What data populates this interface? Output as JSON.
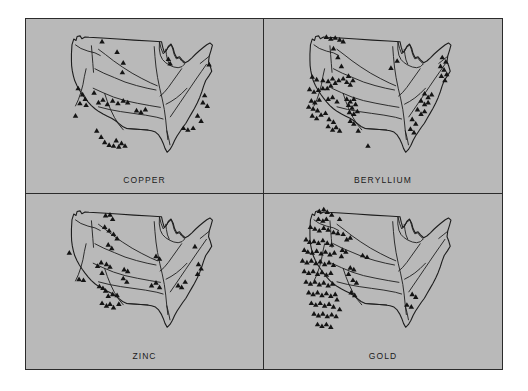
{
  "figure": {
    "background_color": "#b9b9b9",
    "page_background_color": "#ffffff",
    "border_color": "#2b2b2b",
    "marker_color": "#141414",
    "marker_shape": "filled-triangle",
    "outline_color": "#1d1d1d",
    "panel_count": 4,
    "map_subject": "United States"
  },
  "panels": [
    {
      "id": "copper",
      "label": "COPPER",
      "position": "top-left",
      "marker_count": 41
    },
    {
      "id": "beryllium",
      "label": "BERYLLIUM",
      "position": "top-right",
      "marker_count": 77
    },
    {
      "id": "zinc",
      "label": "ZINC",
      "position": "bottom-left",
      "marker_count": 43
    },
    {
      "id": "gold",
      "label": "GOLD",
      "position": "bottom-right",
      "marker_count": 95
    }
  ],
  "chart_data": {
    "type": "scatter",
    "title": "",
    "subtitle": "",
    "xlabel": "",
    "ylabel": "",
    "grid": false,
    "legend": "none",
    "panels": [
      {
        "name": "COPPER",
        "marker": "triangle",
        "count": 41,
        "points": [
          [
            26.0,
            11.5
          ],
          [
            34.5,
            17.5
          ],
          [
            38.0,
            23.5
          ],
          [
            37.5,
            29.0
          ],
          [
            12.5,
            38.0
          ],
          [
            15.0,
            41.5
          ],
          [
            16.5,
            44.0
          ],
          [
            13.5,
            46.5
          ],
          [
            17.0,
            47.5
          ],
          [
            21.5,
            40.5
          ],
          [
            24.0,
            46.0
          ],
          [
            26.5,
            44.5
          ],
          [
            29.0,
            47.0
          ],
          [
            32.0,
            45.0
          ],
          [
            35.0,
            46.5
          ],
          [
            38.0,
            45.0
          ],
          [
            40.5,
            46.0
          ],
          [
            11.0,
            53.5
          ],
          [
            23.0,
            62.0
          ],
          [
            25.5,
            65.5
          ],
          [
            27.5,
            68.5
          ],
          [
            30.0,
            70.0
          ],
          [
            32.5,
            70.5
          ],
          [
            34.0,
            67.5
          ],
          [
            35.5,
            71.0
          ],
          [
            37.0,
            69.0
          ],
          [
            39.0,
            70.5
          ],
          [
            45.5,
            50.5
          ],
          [
            48.0,
            51.5
          ],
          [
            50.5,
            50.0
          ],
          [
            63.5,
            21.5
          ],
          [
            64.5,
            24.0
          ],
          [
            86.5,
            24.5
          ],
          [
            84.0,
            42.0
          ],
          [
            83.0,
            46.0
          ],
          [
            85.5,
            48.0
          ],
          [
            80.0,
            53.5
          ],
          [
            82.0,
            56.5
          ],
          [
            77.5,
            60.5
          ],
          [
            74.5,
            61.5
          ],
          [
            72.0,
            60.5
          ]
        ]
      },
      {
        "name": "BERYLLIUM",
        "marker": "triangle",
        "count": 77,
        "points": [
          [
            18.0,
            9.0
          ],
          [
            20.5,
            10.0
          ],
          [
            23.0,
            9.5
          ],
          [
            25.5,
            10.5
          ],
          [
            27.5,
            11.5
          ],
          [
            22.0,
            15.5
          ],
          [
            24.5,
            20.5
          ],
          [
            26.5,
            25.5
          ],
          [
            10.0,
            31.5
          ],
          [
            12.5,
            33.0
          ],
          [
            16.0,
            33.5
          ],
          [
            19.0,
            34.0
          ],
          [
            21.5,
            32.5
          ],
          [
            8.5,
            38.5
          ],
          [
            11.0,
            40.0
          ],
          [
            13.5,
            39.0
          ],
          [
            16.0,
            38.0
          ],
          [
            18.5,
            38.0
          ],
          [
            20.5,
            36.5
          ],
          [
            23.0,
            35.0
          ],
          [
            25.0,
            33.5
          ],
          [
            27.5,
            32.5
          ],
          [
            29.5,
            34.5
          ],
          [
            9.5,
            45.0
          ],
          [
            11.5,
            46.0
          ],
          [
            14.0,
            44.5
          ],
          [
            8.0,
            48.5
          ],
          [
            10.5,
            49.5
          ],
          [
            13.0,
            50.5
          ],
          [
            10.0,
            53.5
          ],
          [
            12.5,
            55.0
          ],
          [
            15.0,
            53.0
          ],
          [
            19.0,
            44.0
          ],
          [
            21.5,
            43.0
          ],
          [
            24.0,
            45.5
          ],
          [
            17.5,
            52.0
          ],
          [
            19.5,
            55.5
          ],
          [
            22.0,
            57.0
          ],
          [
            19.0,
            59.5
          ],
          [
            21.5,
            61.5
          ],
          [
            23.5,
            60.0
          ],
          [
            25.5,
            62.0
          ],
          [
            30.5,
            31.0
          ],
          [
            33.0,
            33.5
          ],
          [
            31.5,
            36.0
          ],
          [
            29.5,
            44.0
          ],
          [
            31.5,
            45.5
          ],
          [
            33.5,
            44.0
          ],
          [
            30.5,
            47.5
          ],
          [
            32.5,
            49.0
          ],
          [
            34.5,
            47.0
          ],
          [
            31.0,
            51.5
          ],
          [
            33.5,
            52.5
          ],
          [
            35.5,
            51.0
          ],
          [
            31.5,
            56.5
          ],
          [
            33.5,
            58.0
          ],
          [
            36.0,
            62.0
          ],
          [
            41.5,
            70.5
          ],
          [
            58.0,
            22.5
          ],
          [
            54.5,
            26.5
          ],
          [
            83.5,
            20.5
          ],
          [
            85.5,
            23.0
          ],
          [
            82.5,
            25.5
          ],
          [
            84.5,
            27.5
          ],
          [
            86.0,
            30.0
          ],
          [
            83.0,
            31.0
          ],
          [
            85.0,
            33.5
          ],
          [
            73.5,
            41.0
          ],
          [
            75.5,
            43.0
          ],
          [
            77.5,
            41.5
          ],
          [
            71.5,
            45.0
          ],
          [
            73.5,
            47.0
          ],
          [
            75.5,
            46.0
          ],
          [
            69.5,
            50.0
          ],
          [
            71.5,
            52.5
          ],
          [
            73.5,
            51.0
          ],
          [
            66.5,
            55.5
          ],
          [
            68.5,
            58.0
          ],
          [
            65.5,
            61.0
          ],
          [
            67.5,
            63.0
          ]
        ]
      },
      {
        "name": "ZINC",
        "marker": "triangle",
        "count": 43,
        "points": [
          [
            28.0,
            11.0
          ],
          [
            30.5,
            10.5
          ],
          [
            32.0,
            13.0
          ],
          [
            27.5,
            17.5
          ],
          [
            30.0,
            19.5
          ],
          [
            32.5,
            21.5
          ],
          [
            34.5,
            24.0
          ],
          [
            29.5,
            27.5
          ],
          [
            31.5,
            29.5
          ],
          [
            7.5,
            32.0
          ],
          [
            23.5,
            39.5
          ],
          [
            25.5,
            37.5
          ],
          [
            28.5,
            38.5
          ],
          [
            30.5,
            40.0
          ],
          [
            26.0,
            43.5
          ],
          [
            13.0,
            47.0
          ],
          [
            15.5,
            47.5
          ],
          [
            24.5,
            51.0
          ],
          [
            26.5,
            52.0
          ],
          [
            28.0,
            53.5
          ],
          [
            29.5,
            56.5
          ],
          [
            32.0,
            55.5
          ],
          [
            34.5,
            56.0
          ],
          [
            26.0,
            60.5
          ],
          [
            28.5,
            62.0
          ],
          [
            30.5,
            61.0
          ],
          [
            32.5,
            63.0
          ],
          [
            35.5,
            61.0
          ],
          [
            38.5,
            41.5
          ],
          [
            40.5,
            42.5
          ],
          [
            38.0,
            46.5
          ],
          [
            40.0,
            48.5
          ],
          [
            56.5,
            34.0
          ],
          [
            58.5,
            35.5
          ],
          [
            54.0,
            50.5
          ],
          [
            56.5,
            49.0
          ],
          [
            58.5,
            51.5
          ],
          [
            69.0,
            50.5
          ],
          [
            71.0,
            51.5
          ],
          [
            73.0,
            48.5
          ],
          [
            78.5,
            28.5
          ],
          [
            80.5,
            38.5
          ],
          [
            82.0,
            41.0
          ],
          [
            80.0,
            44.0
          ]
        ]
      },
      {
        "name": "GOLD",
        "marker": "triangle",
        "count": 95,
        "points": [
          [
            14.0,
            8.5
          ],
          [
            16.5,
            7.5
          ],
          [
            18.5,
            9.0
          ],
          [
            21.0,
            10.5
          ],
          [
            13.5,
            13.0
          ],
          [
            16.0,
            14.0
          ],
          [
            18.0,
            13.0
          ],
          [
            9.0,
            17.5
          ],
          [
            11.5,
            18.5
          ],
          [
            14.0,
            19.5
          ],
          [
            16.5,
            18.0
          ],
          [
            19.0,
            19.0
          ],
          [
            22.0,
            20.5
          ],
          [
            24.5,
            21.0
          ],
          [
            6.5,
            24.5
          ],
          [
            8.5,
            26.0
          ],
          [
            11.0,
            25.5
          ],
          [
            13.5,
            26.5
          ],
          [
            16.0,
            25.0
          ],
          [
            18.5,
            26.5
          ],
          [
            21.0,
            27.5
          ],
          [
            5.5,
            30.5
          ],
          [
            7.5,
            31.5
          ],
          [
            10.0,
            32.0
          ],
          [
            12.5,
            31.0
          ],
          [
            15.0,
            32.5
          ],
          [
            17.5,
            31.5
          ],
          [
            20.0,
            33.0
          ],
          [
            22.5,
            32.0
          ],
          [
            4.5,
            36.5
          ],
          [
            7.0,
            37.5
          ],
          [
            9.5,
            36.5
          ],
          [
            12.0,
            38.0
          ],
          [
            14.5,
            37.0
          ],
          [
            17.0,
            38.5
          ],
          [
            19.5,
            37.5
          ],
          [
            22.0,
            39.0
          ],
          [
            5.5,
            42.5
          ],
          [
            8.0,
            43.5
          ],
          [
            10.5,
            42.5
          ],
          [
            13.0,
            44.0
          ],
          [
            15.5,
            43.0
          ],
          [
            18.0,
            44.5
          ],
          [
            20.5,
            43.5
          ],
          [
            6.5,
            48.5
          ],
          [
            9.0,
            49.5
          ],
          [
            11.5,
            48.5
          ],
          [
            14.0,
            50.0
          ],
          [
            16.5,
            49.0
          ],
          [
            19.0,
            50.5
          ],
          [
            21.5,
            49.5
          ],
          [
            8.0,
            54.5
          ],
          [
            10.5,
            55.5
          ],
          [
            13.0,
            54.5
          ],
          [
            15.5,
            56.0
          ],
          [
            18.0,
            55.0
          ],
          [
            20.5,
            56.5
          ],
          [
            23.0,
            55.5
          ],
          [
            9.5,
            60.5
          ],
          [
            12.0,
            61.5
          ],
          [
            14.5,
            60.5
          ],
          [
            17.0,
            62.0
          ],
          [
            19.5,
            61.0
          ],
          [
            22.0,
            62.5
          ],
          [
            11.0,
            66.5
          ],
          [
            13.5,
            67.5
          ],
          [
            16.0,
            66.5
          ],
          [
            18.5,
            68.0
          ],
          [
            21.0,
            67.0
          ],
          [
            23.5,
            68.0
          ],
          [
            13.0,
            72.5
          ],
          [
            15.5,
            73.5
          ],
          [
            18.0,
            72.5
          ],
          [
            20.5,
            74.0
          ],
          [
            25.5,
            13.0
          ],
          [
            27.5,
            21.5
          ],
          [
            29.5,
            24.5
          ],
          [
            31.5,
            23.5
          ],
          [
            27.0,
            30.5
          ],
          [
            29.0,
            31.5
          ],
          [
            26.5,
            34.0
          ],
          [
            31.5,
            40.5
          ],
          [
            33.5,
            41.5
          ],
          [
            30.5,
            44.0
          ],
          [
            33.0,
            47.5
          ],
          [
            35.0,
            49.0
          ],
          [
            32.0,
            54.5
          ],
          [
            34.0,
            56.0
          ],
          [
            38.5,
            33.5
          ],
          [
            41.0,
            34.5
          ],
          [
            24.0,
            58.5
          ],
          [
            25.5,
            64.0
          ],
          [
            66.5,
            55.5
          ],
          [
            68.5,
            57.0
          ],
          [
            63.5,
            61.5
          ],
          [
            66.0,
            62.5
          ]
        ]
      }
    ]
  }
}
